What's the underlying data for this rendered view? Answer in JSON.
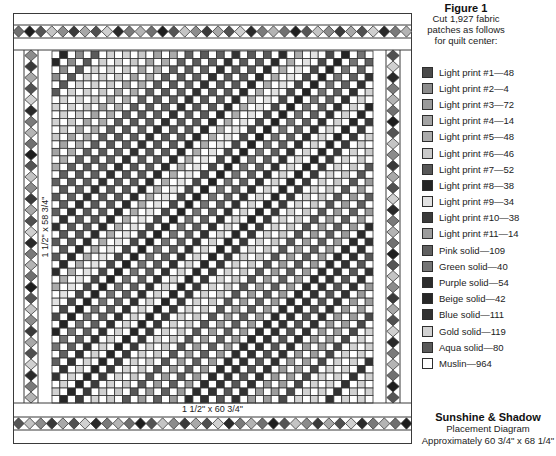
{
  "header": {
    "title": "Figure 1",
    "lines": [
      "Cut 1,927 fabric",
      "patches as follows",
      "for quilt center:"
    ]
  },
  "legend_separator": "—",
  "legend": [
    {
      "label": "Light print #1",
      "count": 48,
      "color": "#4a4a4a"
    },
    {
      "label": "Light print #2",
      "count": 4,
      "color": "#8c8c8c"
    },
    {
      "label": "Light print #3",
      "count": 72,
      "color": "#9a9a9a"
    },
    {
      "label": "Light print #4",
      "count": 14,
      "color": "#a3a3a3"
    },
    {
      "label": "Light print #5",
      "count": 48,
      "color": "#ababab"
    },
    {
      "label": "Light print #6",
      "count": 46,
      "color": "#c9c9c9"
    },
    {
      "label": "Light print #7",
      "count": 52,
      "color": "#575757"
    },
    {
      "label": "Light print #8",
      "count": 38,
      "color": "#242424"
    },
    {
      "label": "Light print #9",
      "count": 34,
      "color": "#e2e2e2"
    },
    {
      "label": "Light print #10",
      "count": 38,
      "color": "#3b3b3b"
    },
    {
      "label": "Light print #11",
      "count": 14,
      "color": "#9c9c9c"
    },
    {
      "label": "Pink solid",
      "count": 109,
      "color": "#606060"
    },
    {
      "label": "Green solid",
      "count": 40,
      "color": "#747474"
    },
    {
      "label": "Purple solid",
      "count": 54,
      "color": "#2c2c2c"
    },
    {
      "label": "Beige solid",
      "count": 42,
      "color": "#272727"
    },
    {
      "label": "Blue solid",
      "count": 111,
      "color": "#323232"
    },
    {
      "label": "Gold solid",
      "count": 119,
      "color": "#d2d2d2"
    },
    {
      "label": "Aqua solid",
      "count": 80,
      "color": "#5a5a5a"
    },
    {
      "label": "Muslin",
      "count": 964,
      "color": "#ffffff"
    }
  ],
  "quilt": {
    "side_border_label": "1 1/2\" x 58 3/4\"",
    "bottom_border_label": "1 1/2\" x 60 3/4\"",
    "grid": {
      "columns": 41,
      "rows": 47,
      "muslin_index": 18,
      "line_color": "#333333"
    },
    "diagonal_sequence": [
      14,
      1,
      17,
      16,
      16,
      5,
      3,
      4,
      11,
      17,
      11,
      15,
      17,
      17,
      13,
      4,
      8,
      0,
      7,
      12,
      11,
      15,
      16,
      14,
      9,
      16,
      5,
      6,
      2,
      11,
      2,
      13,
      15,
      6,
      15,
      2,
      10,
      0,
      16,
      16,
      15,
      16,
      16
    ],
    "diamond_palette": [
      "#707070",
      "#1e1e1e",
      "#555555",
      "#c4c4c4",
      "#8c8c8c",
      "#3a3a3a",
      "#a8a8a8",
      "#505050",
      "#d0d0d0",
      "#2a2a2a",
      "#7a7a7a",
      "#b4b4b4"
    ],
    "diamond_counts": {
      "top": 36,
      "bottom": 36,
      "left": 32,
      "right": 32
    },
    "outline_color": "#3a3a3a"
  },
  "caption": {
    "title": "Sunshine & Shadow",
    "subtitle": "Placement Diagram",
    "size": "Approximately 60 3/4\" x 68 1/4\""
  }
}
